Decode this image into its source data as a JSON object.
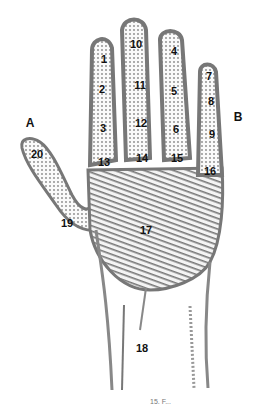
{
  "diagram": {
    "type": "palmistry hand chart",
    "side_labels": [
      {
        "id": "A",
        "text": "A",
        "x": 30,
        "y": 123
      },
      {
        "id": "B",
        "text": "B",
        "x": 238,
        "y": 117
      }
    ],
    "regions": [
      {
        "id": 1,
        "text": "1",
        "x": 104,
        "y": 59
      },
      {
        "id": 2,
        "text": "2",
        "x": 102,
        "y": 89
      },
      {
        "id": 3,
        "text": "3",
        "x": 103,
        "y": 128
      },
      {
        "id": 4,
        "text": "4",
        "x": 174,
        "y": 51
      },
      {
        "id": 5,
        "text": "5",
        "x": 174,
        "y": 91
      },
      {
        "id": 6,
        "text": "6",
        "x": 176,
        "y": 129
      },
      {
        "id": 7,
        "text": "7",
        "x": 209,
        "y": 76
      },
      {
        "id": 8,
        "text": "8",
        "x": 211,
        "y": 101
      },
      {
        "id": 9,
        "text": "9",
        "x": 212,
        "y": 134
      },
      {
        "id": 10,
        "text": "10",
        "x": 136,
        "y": 44
      },
      {
        "id": 11,
        "text": "11",
        "x": 140,
        "y": 85
      },
      {
        "id": 12,
        "text": "12",
        "x": 141,
        "y": 123
      },
      {
        "id": 13,
        "text": "13",
        "x": 104,
        "y": 162
      },
      {
        "id": 14,
        "text": "14",
        "x": 142,
        "y": 158
      },
      {
        "id": 15,
        "text": "15",
        "x": 177,
        "y": 158
      },
      {
        "id": 16,
        "text": "16",
        "x": 210,
        "y": 171
      },
      {
        "id": 17,
        "text": "17",
        "x": 146,
        "y": 230
      },
      {
        "id": 18,
        "text": "18",
        "x": 142,
        "y": 348
      },
      {
        "id": 19,
        "text": "19",
        "x": 67,
        "y": 223
      },
      {
        "id": 20,
        "text": "20",
        "x": 37,
        "y": 154
      }
    ],
    "caption": "15. F..."
  }
}
